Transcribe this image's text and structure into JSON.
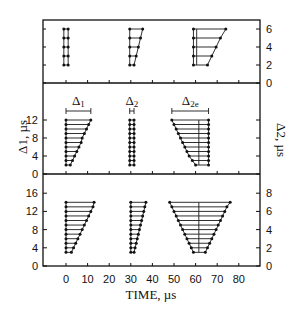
{
  "chart_data": {
    "type": "scatter",
    "title": "",
    "xlabel": "TIME, µs",
    "x_ticks": [
      0,
      10,
      20,
      30,
      40,
      50,
      60,
      70,
      80
    ],
    "xlim": [
      -10,
      90
    ],
    "panels": [
      {
        "name": "top",
        "ylabel_left": "",
        "ylabel_right": "",
        "right_ticks": [
          0,
          2,
          4,
          6
        ],
        "ylim_right": [
          0,
          6.5
        ],
        "groups": [
          {
            "name": "group-1",
            "levels": [
              2,
              3,
              4,
              5,
              6
            ],
            "left_t": [
              -1,
              -1,
              -1,
              -1,
              -1
            ],
            "right_t": [
              1,
              1,
              1,
              1,
              1
            ]
          },
          {
            "name": "group-2",
            "levels": [
              2,
              3,
              4,
              5,
              6
            ],
            "left_t": [
              29.5,
              29.5,
              29.5,
              29.5,
              29.5
            ],
            "right_t": [
              31.5,
              32.5,
              33.5,
              34.5,
              35.5
            ]
          },
          {
            "name": "group-3",
            "levels": [
              2,
              3,
              4,
              5,
              6
            ],
            "left_t": [
              59,
              59,
              59,
              59,
              59
            ],
            "right_t": [
              65.5,
              67.5,
              69.5,
              71.5,
              74
            ],
            "center_t": 60.5
          }
        ]
      },
      {
        "name": "middle",
        "ylabel_left": "Δ1, µs",
        "ylabel_right": "Δ2, µs",
        "left_ticks": [
          0,
          4,
          8,
          12
        ],
        "ylim_left": [
          0,
          18
        ],
        "annotations": [
          {
            "text": "Δ1",
            "from_t": 0,
            "to_t": 11.5
          },
          {
            "text": "Δ2",
            "from_t": 29.5,
            "to_t": 31.5
          },
          {
            "text": "Δ2e",
            "from_t": 49,
            "to_t": 66
          }
        ],
        "groups": [
          {
            "name": "delta-1",
            "levels": [
              2,
              3,
              4,
              5,
              6,
              7,
              8,
              9,
              10,
              11,
              12
            ],
            "left_t": [
              0,
              0,
              0,
              0,
              0,
              0,
              0,
              0,
              0,
              0,
              0
            ],
            "right_t": [
              2,
              3,
              4,
              5,
              6,
              7,
              7.5,
              8.5,
              9.5,
              10.5,
              11.5
            ]
          },
          {
            "name": "delta-2",
            "levels": [
              2,
              3,
              4,
              5,
              6,
              7,
              8,
              9,
              10,
              11,
              12
            ],
            "left_t": [
              29.5,
              29.5,
              29.5,
              29.5,
              29.5,
              29.5,
              29.5,
              29.5,
              29.5,
              29.5,
              29.5
            ],
            "right_t": [
              31.5,
              31.5,
              31.5,
              31.5,
              31.5,
              31.5,
              31.5,
              31.5,
              31.5,
              31.5,
              31.5
            ]
          },
          {
            "name": "delta-2e",
            "levels": [
              2,
              3,
              4,
              5,
              6,
              7,
              8,
              9,
              10,
              11,
              12
            ],
            "left_t": [
              60,
              58.5,
              57,
              56,
              55,
              54,
              53,
              52,
              51,
              50,
              49
            ],
            "right_t": [
              66,
              66,
              66,
              66,
              66,
              66,
              66,
              66,
              66,
              66,
              66
            ],
            "center_t": 61.5
          }
        ]
      },
      {
        "name": "bottom",
        "left_ticks": [
          0,
          4,
          8,
          12,
          16
        ],
        "right_ticks": [
          0,
          2,
          4,
          6,
          8
        ],
        "ylim_left": [
          0,
          18
        ],
        "groups": [
          {
            "name": "group-1",
            "levels": [
              3,
              4,
              5,
              6,
              7,
              8,
              9,
              10,
              11,
              12,
              13,
              14
            ],
            "left_t": [
              0,
              0,
              0,
              0,
              0,
              0,
              0,
              0,
              0,
              0,
              0,
              0
            ],
            "right_t": [
              2.5,
              3.5,
              4.5,
              5.5,
              6.5,
              7.5,
              8.5,
              9.5,
              10.5,
              11.5,
              12.5,
              13
            ]
          },
          {
            "name": "group-2",
            "levels": [
              3,
              4,
              5,
              6,
              7,
              8,
              9,
              10,
              11,
              12,
              13,
              14
            ],
            "left_t": [
              30,
              30,
              30,
              30,
              30,
              30,
              30,
              30,
              30,
              30,
              30,
              30
            ],
            "right_t": [
              31.5,
              32,
              32.5,
              33,
              33.5,
              34,
              34.5,
              35,
              35.5,
              36,
              36.5,
              37
            ]
          },
          {
            "name": "group-3",
            "levels": [
              3,
              4,
              5,
              6,
              7,
              8,
              9,
              10,
              11,
              12,
              13,
              14
            ],
            "left_t": [
              59,
              58,
              57,
              56,
              55,
              54,
              53,
              52,
              51,
              50,
              49,
              48
            ],
            "right_t": [
              64.5,
              65.5,
              66.5,
              67.5,
              68.5,
              69.5,
              70.5,
              71.5,
              72.5,
              73.5,
              74.5,
              76
            ],
            "center_t": 61.5
          }
        ]
      }
    ]
  },
  "labels": {
    "xlabel": "TIME, µs",
    "mid_ylabel_left": "Δ1, µs",
    "mid_ylabel_right": "Δ2, µs",
    "ann_d1": "Δ",
    "ann_d1_sub": "1",
    "ann_d2": "Δ",
    "ann_d2_sub": "2",
    "ann_d2e": "Δ",
    "ann_d2e_sub": "2e"
  }
}
